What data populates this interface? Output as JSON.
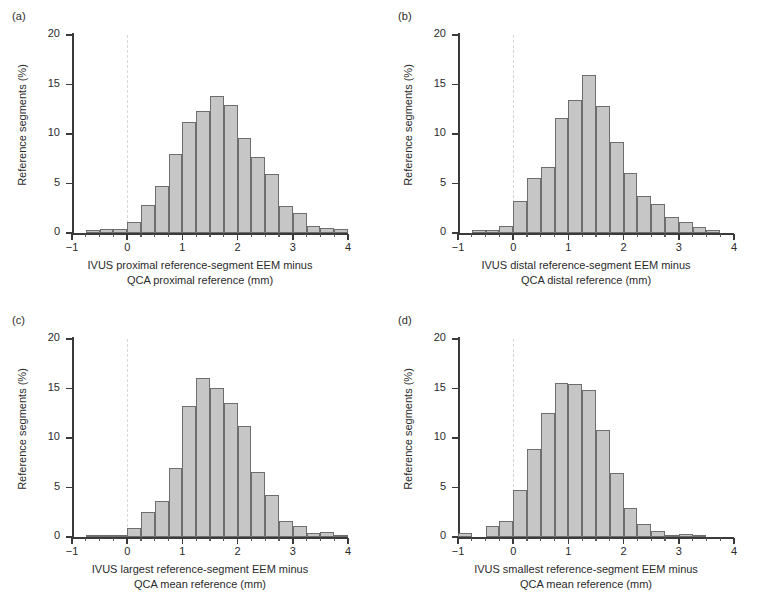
{
  "figure": {
    "width": 772,
    "height": 609,
    "bar_fill": "#c6c6c6",
    "bar_stroke": "#6e6e6e",
    "axis_color": "#3a3a3a",
    "zeroline_color": "#d8d8d8"
  },
  "panels": [
    {
      "letter": "(a)",
      "ylabel": "Reference segments (%)",
      "xcaption_line1": "IVUS proximal reference-segment EEM minus",
      "xcaption_line2": "QCA proximal reference (mm)",
      "chart_data": {
        "type": "bar",
        "title": "(a) IVUS proximal reference-segment EEM minus QCA proximal reference",
        "xlabel": "IVUS proximal reference-segment EEM minus QCA proximal reference (mm)",
        "ylabel": "Reference segments (%)",
        "xlim": [
          -1,
          4
        ],
        "ylim": [
          0,
          20
        ],
        "xticks": [
          -1,
          0,
          1,
          2,
          3,
          4
        ],
        "yticks": [
          0,
          5,
          10,
          15,
          20
        ],
        "bin_width": 0.25,
        "grid": false,
        "legend": "none",
        "bin_starts": [
          -0.75,
          -0.5,
          -0.25,
          0,
          0.25,
          0.5,
          0.75,
          1,
          1.25,
          1.5,
          1.75,
          2,
          2.25,
          2.5,
          2.75,
          3,
          3.25,
          3.5,
          3.75
        ],
        "values": [
          0.3,
          0.4,
          0.4,
          1.1,
          2.8,
          4.7,
          8.0,
          11.2,
          12.3,
          13.8,
          12.9,
          9.6,
          7.7,
          6.0,
          2.7,
          2.0,
          0.7,
          0.5,
          0.4
        ]
      }
    },
    {
      "letter": "(b)",
      "ylabel": "Reference segments (%)",
      "xcaption_line1": "IVUS distal reference-segment EEM minus",
      "xcaption_line2": "QCA distal reference (mm)",
      "chart_data": {
        "type": "bar",
        "title": "(b) IVUS distal reference-segment EEM minus QCA distal reference",
        "xlabel": "IVUS distal reference-segment EEM minus QCA distal reference (mm)",
        "ylabel": "Reference segments (%)",
        "xlim": [
          -1,
          4
        ],
        "ylim": [
          0,
          20
        ],
        "xticks": [
          -1,
          0,
          1,
          2,
          3,
          4
        ],
        "yticks": [
          0,
          5,
          10,
          15,
          20
        ],
        "bin_width": 0.25,
        "grid": false,
        "legend": "none",
        "bin_starts": [
          -0.75,
          -0.5,
          -0.25,
          0,
          0.25,
          0.5,
          0.75,
          1,
          1.25,
          1.5,
          1.75,
          2,
          2.25,
          2.5,
          2.75,
          3,
          3.25,
          3.5
        ],
        "values": [
          0.3,
          0.3,
          0.7,
          3.2,
          5.6,
          6.7,
          11.6,
          13.4,
          16.0,
          12.8,
          9.2,
          6.1,
          3.7,
          2.9,
          1.6,
          1.1,
          0.6,
          0.3
        ]
      }
    },
    {
      "letter": "(c)",
      "ylabel": "Reference segments (%)",
      "xcaption_line1": "IVUS largest reference-segment EEM minus",
      "xcaption_line2": "QCA mean reference (mm)",
      "chart_data": {
        "type": "bar",
        "title": "(c) IVUS largest reference-segment EEM minus QCA mean reference",
        "xlabel": "IVUS largest reference-segment EEM minus QCA mean reference (mm)",
        "ylabel": "Reference segments (%)",
        "xlim": [
          -1,
          4
        ],
        "ylim": [
          0,
          20
        ],
        "xticks": [
          -1,
          0,
          1,
          2,
          3,
          4
        ],
        "yticks": [
          0,
          5,
          10,
          15,
          20
        ],
        "bin_width": 0.25,
        "grid": false,
        "legend": "none",
        "bin_starts": [
          -0.75,
          -0.5,
          -0.25,
          0,
          0.25,
          0.5,
          0.75,
          1,
          1.25,
          1.5,
          1.75,
          2,
          2.25,
          2.5,
          2.75,
          3,
          3.25,
          3.5,
          3.75
        ],
        "values": [
          0.2,
          0.1,
          0.2,
          0.9,
          2.5,
          3.6,
          7.0,
          13.2,
          16.1,
          15.1,
          13.5,
          11.2,
          6.6,
          4.2,
          1.6,
          1.1,
          0.4,
          0.5,
          0.2
        ]
      }
    },
    {
      "letter": "(d)",
      "ylabel": "Reference segments (%)",
      "xcaption_line1": "IVUS smallest reference-segment EEM minus",
      "xcaption_line2": "QCA mean reference (mm)",
      "chart_data": {
        "type": "bar",
        "title": "(d) IVUS smallest reference-segment EEM minus QCA mean reference",
        "xlabel": "IVUS smallest reference-segment EEM minus QCA mean reference (mm)",
        "ylabel": "Reference segments (%)",
        "xlim": [
          -1,
          4
        ],
        "ylim": [
          0,
          20
        ],
        "xticks": [
          -1,
          0,
          1,
          2,
          3,
          4
        ],
        "yticks": [
          0,
          5,
          10,
          15,
          20
        ],
        "bin_width": 0.25,
        "grid": false,
        "legend": "none",
        "bin_starts": [
          -1,
          -0.5,
          -0.25,
          0,
          0.25,
          0.5,
          0.75,
          1,
          1.25,
          1.5,
          1.75,
          2,
          2.25,
          2.5,
          2.75,
          3,
          3.25
        ],
        "values": [
          0.4,
          1.1,
          1.6,
          4.7,
          8.9,
          12.5,
          15.6,
          15.5,
          14.8,
          10.8,
          6.5,
          2.9,
          1.3,
          0.6,
          0.1,
          0.3,
          0.05
        ]
      }
    }
  ]
}
